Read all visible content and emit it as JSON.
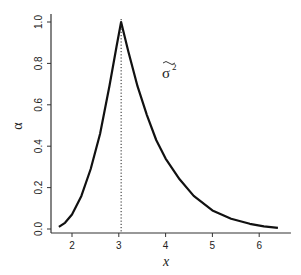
{
  "chart_data": {
    "type": "line",
    "title": "",
    "xlabel": "x",
    "ylabel": "α",
    "xlim": [
      1.6,
      6.55
    ],
    "ylim": [
      0.0,
      1.0
    ],
    "x_ticks": [
      2,
      3,
      4,
      5,
      6
    ],
    "y_ticks": [
      0.0,
      0.2,
      0.4,
      0.6,
      0.8,
      1.0
    ],
    "x_tick_labels": [
      "2",
      "3",
      "4",
      "5",
      "6"
    ],
    "y_tick_labels": [
      "0.0",
      "0.2",
      "0.4",
      "0.6",
      "0.8",
      "1.0"
    ],
    "grid": false,
    "legend": null,
    "annotations": [
      {
        "text": "σ̃²",
        "x": 3.95,
        "y": 0.82,
        "description": "sigma-squared tilde label"
      },
      {
        "type": "vline",
        "x": 3.05,
        "style": "dotted",
        "ymax": 1.0
      }
    ],
    "series": [
      {
        "name": "alpha",
        "x": [
          1.72,
          1.85,
          2.0,
          2.2,
          2.4,
          2.6,
          2.8,
          2.95,
          3.05,
          3.2,
          3.4,
          3.6,
          3.8,
          4.0,
          4.3,
          4.6,
          5.0,
          5.4,
          5.8,
          6.1,
          6.4
        ],
        "values": [
          0.01,
          0.03,
          0.07,
          0.16,
          0.29,
          0.46,
          0.69,
          0.88,
          1.0,
          0.86,
          0.69,
          0.55,
          0.43,
          0.34,
          0.24,
          0.16,
          0.09,
          0.05,
          0.025,
          0.013,
          0.006
        ]
      }
    ]
  }
}
